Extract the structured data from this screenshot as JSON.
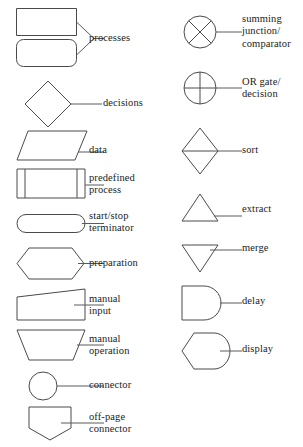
{
  "diagram": {
    "stroke_color": "#4a4a4a",
    "leader_color": "#5a5a5a",
    "background_color": "#ffffff",
    "text_color": "#1c1c1c",
    "columns": [
      {
        "name": "left",
        "entries": [
          {
            "symbol": "process",
            "label": "processes"
          },
          {
            "symbol": "decision",
            "label": "decisions"
          },
          {
            "symbol": "data",
            "label": "data"
          },
          {
            "symbol": "predefined-process",
            "label": "predefined\nprocess"
          },
          {
            "symbol": "start-stop-terminator",
            "label": "start/stop\nterminator"
          },
          {
            "symbol": "preparation",
            "label": "preparation"
          },
          {
            "symbol": "manual-input",
            "label": "manual\ninput"
          },
          {
            "symbol": "manual-operation",
            "label": "manual\noperation"
          },
          {
            "symbol": "connector",
            "label": "connector"
          },
          {
            "symbol": "off-page-connector",
            "label": "off-page\nconnector"
          }
        ]
      },
      {
        "name": "right",
        "entries": [
          {
            "symbol": "summing-junction",
            "label": "summing\njunction/\ncomparator"
          },
          {
            "symbol": "or-gate",
            "label": "OR gate/\ndecision"
          },
          {
            "symbol": "sort",
            "label": "sort"
          },
          {
            "symbol": "extract",
            "label": "extract"
          },
          {
            "symbol": "merge",
            "label": "merge"
          },
          {
            "symbol": "delay",
            "label": "delay"
          },
          {
            "symbol": "display",
            "label": "display"
          }
        ]
      }
    ]
  }
}
